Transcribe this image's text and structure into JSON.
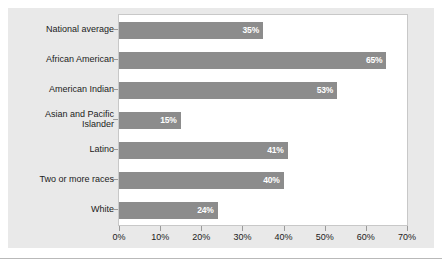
{
  "chart_data": {
    "type": "bar",
    "orientation": "horizontal",
    "title": "",
    "xlabel": "",
    "ylabel": "",
    "xlim": [
      0,
      70
    ],
    "grid": false,
    "legend": null,
    "categories": [
      "National average",
      "African American",
      "American Indian",
      "Asian and Pacific\nIslander",
      "Latino",
      "Two or more races",
      "White"
    ],
    "values": [
      35,
      65,
      53,
      15,
      41,
      40,
      24
    ],
    "value_labels": [
      "35%",
      "65%",
      "53%",
      "15%",
      "41%",
      "40%",
      "24%"
    ],
    "xticks": [
      0,
      10,
      20,
      30,
      40,
      50,
      60,
      70
    ],
    "xtick_labels": [
      "0%",
      "10%",
      "20%",
      "30%",
      "40%",
      "50%",
      "60%",
      "70%"
    ],
    "bar_color": "#8c8c8c",
    "plot_background": "#ffffff",
    "panel_background": "#e9e9e9",
    "label_color": "#ffffff"
  }
}
